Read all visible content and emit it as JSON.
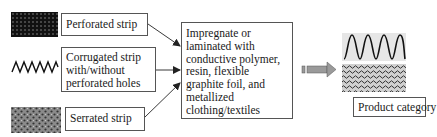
{
  "diagram": {
    "inputs": [
      {
        "id": "perforated",
        "label_lines": [
          "Perforated strip"
        ],
        "icon": "perforated-strip-swatch"
      },
      {
        "id": "corrugated",
        "label_lines": [
          "Corrugated strip",
          "with/without",
          "perforated holes"
        ],
        "icon": "corrugated-wave"
      },
      {
        "id": "serrated",
        "label_lines": [
          "Serrated strip"
        ],
        "icon": "serrated-strip-swatch"
      }
    ],
    "process": {
      "label_lines": [
        "Impregnate or",
        "laminated with",
        "conductive polymer,",
        "resin, flexible",
        "graphite foil, and",
        "metallized",
        "clothing/textiles"
      ]
    },
    "output": {
      "label": "Product category 3",
      "icons": [
        "corrugated-wave-large",
        "wavy-mesh-swatch"
      ]
    },
    "colors": {
      "border": "#555555",
      "arrow": "#222222",
      "block_arrow_fill": "#9a9a9a",
      "perforated_fill": "#111111",
      "serrated_fill": "#8a8a8a"
    }
  }
}
